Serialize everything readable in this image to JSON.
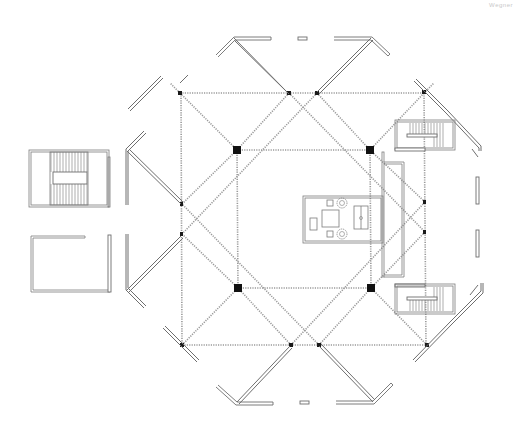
{
  "drawing": {
    "type": "architectural-floor-plan",
    "annotation": "Wegner",
    "colors": {
      "background": "#ffffff",
      "wall_stroke": "#6e6e6e",
      "grid_dotted": "#9a9a9a",
      "column_fill": "#111111"
    },
    "elements": {
      "structural_grid": "dotted diagonal and orthogonal structural grid lines",
      "large_columns": 4,
      "small_columns": 12,
      "stair_cores": [
        "left stair core",
        "right upper stair",
        "right lower stair"
      ],
      "central_furniture": "table with two round chairs, desk, sofa",
      "perimeter_walls": "angled V-shaped wall segments around octagonal footprint"
    }
  }
}
